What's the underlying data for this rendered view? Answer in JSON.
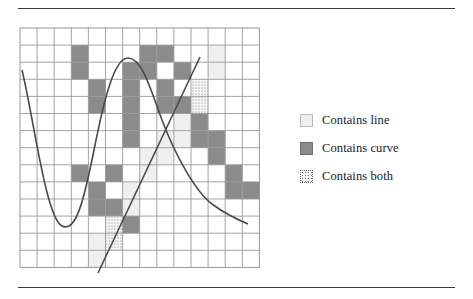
{
  "figure": {
    "grid": {
      "cols": 14,
      "rows": 14,
      "x": 20,
      "y": 28,
      "cell": 17.1,
      "line_color": "#9a9a9a",
      "border_color": "#8a8a8a"
    },
    "colors": {
      "curve_fill": "#8b8b8b",
      "line_fill": "#efefef",
      "both_fill": "#f4f4f4",
      "stroke": "#4a4a4a",
      "rule": "#3a3a3a"
    },
    "cells_curve": [
      [
        3,
        1
      ],
      [
        3,
        2
      ],
      [
        4,
        3
      ],
      [
        4,
        4
      ],
      [
        3,
        8
      ],
      [
        4,
        9
      ],
      [
        4,
        10
      ],
      [
        5,
        10
      ],
      [
        5,
        11
      ],
      [
        6,
        11
      ],
      [
        5,
        8
      ],
      [
        6,
        6
      ],
      [
        6,
        5
      ],
      [
        6,
        4
      ],
      [
        6,
        3
      ],
      [
        6,
        2
      ],
      [
        7,
        1
      ],
      [
        7,
        2
      ],
      [
        8,
        1
      ],
      [
        8,
        3
      ],
      [
        8,
        4
      ],
      [
        9,
        4
      ],
      [
        10,
        5
      ],
      [
        10,
        6
      ],
      [
        11,
        6
      ],
      [
        11,
        7
      ],
      [
        12,
        8
      ],
      [
        13,
        9
      ],
      [
        12,
        9
      ],
      [
        9,
        2
      ]
    ],
    "cells_line": [
      [
        10,
        3
      ],
      [
        10,
        4
      ],
      [
        9,
        5
      ],
      [
        9,
        6
      ],
      [
        8,
        6
      ],
      [
        8,
        7
      ],
      [
        7,
        7
      ],
      [
        7,
        8
      ],
      [
        6,
        9
      ],
      [
        6,
        10
      ],
      [
        5,
        11
      ],
      [
        5,
        12
      ],
      [
        4,
        12
      ],
      [
        4,
        13
      ],
      [
        11,
        2
      ],
      [
        11,
        1
      ]
    ],
    "cells_both": [
      [
        10,
        3
      ],
      [
        10,
        4
      ],
      [
        5,
        11
      ],
      [
        5,
        12
      ]
    ],
    "curve_path": "M 22 70 C 34 120, 46 218, 62 226 C 76 233, 84 200, 94 150 C 104 100, 114 58, 128 58 C 142 58, 150 88, 162 120 C 176 157, 196 192, 212 204 C 224 213, 236 219, 248 224",
    "line_path": "M 98 273 L 200 57",
    "curve_label": "cubic curve",
    "line_label": "straight line"
  },
  "legend": {
    "items": [
      {
        "swatch": "line",
        "label": "Contains line"
      },
      {
        "swatch": "curve",
        "label": "Contains curve"
      },
      {
        "swatch": "both",
        "label": "Contains both"
      }
    ]
  },
  "rules": {
    "top_label": "top rule",
    "bottom_label": "bottom rule"
  }
}
